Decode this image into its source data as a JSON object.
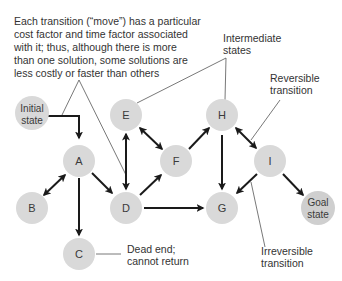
{
  "diagram": {
    "type": "state-space-graph",
    "colors": {
      "node_fill": "#d9d9d9",
      "edge": "#1a1a1a",
      "text": "#333333",
      "background": "#ffffff"
    },
    "annotations": {
      "main_note": [
        "Each transition (“move”) has a particular",
        "cost factor and time factor associated",
        "with it; thus, although there is more",
        "than one solution, some solutions are",
        "less costly or faster than others"
      ],
      "intermediate": [
        "Intermediate",
        "states"
      ],
      "reversible": [
        "Reversible",
        "transition"
      ],
      "dead_end": [
        "Dead end;",
        "cannot return"
      ],
      "irreversible": [
        "Irreversible",
        "transition"
      ]
    },
    "nodes": {
      "initial": [
        "Initial",
        "state"
      ],
      "A": "A",
      "B": "B",
      "C": "C",
      "D": "D",
      "E": "E",
      "F": "F",
      "G": "G",
      "H": "H",
      "I": "I",
      "goal": [
        "Goal",
        "state"
      ]
    },
    "edges": [
      {
        "from": "Initial state",
        "to": "A",
        "type": "irreversible"
      },
      {
        "from": "A",
        "to": "B",
        "type": "reversible"
      },
      {
        "from": "A",
        "to": "C",
        "type": "irreversible"
      },
      {
        "from": "A",
        "to": "D",
        "type": "irreversible"
      },
      {
        "from": "D",
        "to": "E",
        "type": "reversible"
      },
      {
        "from": "E",
        "to": "F",
        "type": "reversible"
      },
      {
        "from": "D",
        "to": "F",
        "type": "irreversible"
      },
      {
        "from": "D",
        "to": "G",
        "type": "irreversible"
      },
      {
        "from": "F",
        "to": "H",
        "type": "irreversible"
      },
      {
        "from": "H",
        "to": "G",
        "type": "irreversible"
      },
      {
        "from": "H",
        "to": "I",
        "type": "reversible"
      },
      {
        "from": "I",
        "to": "G",
        "type": "irreversible"
      },
      {
        "from": "I",
        "to": "Goal state",
        "type": "irreversible"
      }
    ]
  }
}
